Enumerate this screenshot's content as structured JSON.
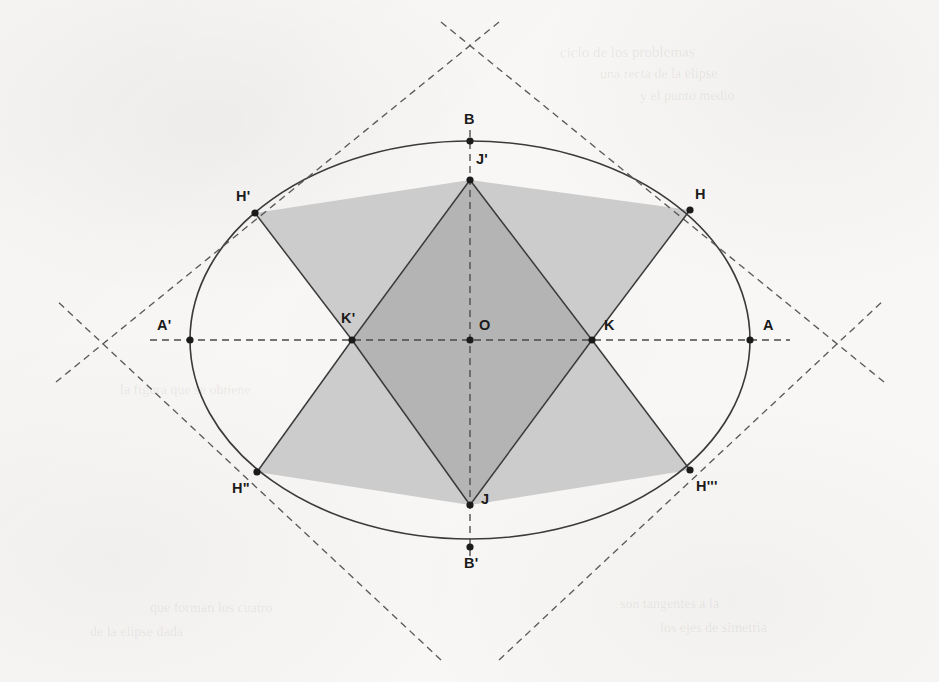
{
  "figure": {
    "background_color": "#f8f7f5",
    "stroke_color": "#3a3a3a",
    "dash_color": "#5a5a5a",
    "fill_light": "#cccccc",
    "fill_dark": "#b4b4b4",
    "point_color": "#1b1b1b",
    "canvas": {
      "width": 939,
      "height": 682
    },
    "ellipse": {
      "center": {
        "x": 470,
        "y": 340
      },
      "semi_major_a": 280,
      "semi_minor_b": 199
    },
    "points": [
      {
        "name": "A",
        "label": "A",
        "x": 750,
        "y": 340,
        "label_x": 763,
        "label_y": 318,
        "dot": true
      },
      {
        "name": "A-prime",
        "label": "A'",
        "x": 190,
        "y": 340,
        "label_x": 157,
        "label_y": 318,
        "dot": true
      },
      {
        "name": "B",
        "label": "B",
        "x": 470,
        "y": 141,
        "label_x": 464,
        "label_y": 112,
        "dot": true
      },
      {
        "name": "B-prime",
        "label": "B'",
        "x": 470,
        "y": 547,
        "label_x": 464,
        "label_y": 556,
        "dot": true
      },
      {
        "name": "O",
        "label": "O",
        "x": 470,
        "y": 340,
        "label_x": 479,
        "label_y": 318,
        "dot": true
      },
      {
        "name": "H",
        "label": "H",
        "x": 690,
        "y": 210,
        "label_x": 695,
        "label_y": 187,
        "dot": true
      },
      {
        "name": "H-prime",
        "label": "H'",
        "x": 255,
        "y": 213,
        "label_x": 236,
        "label_y": 189,
        "dot": true
      },
      {
        "name": "H-double-prime",
        "label": "H\"",
        "x": 257,
        "y": 472,
        "label_x": 232,
        "label_y": 481,
        "dot": true
      },
      {
        "name": "H-triple-prime",
        "label": "H'''",
        "x": 690,
        "y": 470,
        "label_x": 696,
        "label_y": 479,
        "dot": true
      },
      {
        "name": "J",
        "label": "J",
        "x": 470,
        "y": 505,
        "label_x": 481,
        "label_y": 492,
        "dot": true
      },
      {
        "name": "J-prime",
        "label": "J'",
        "x": 470,
        "y": 180,
        "label_x": 476,
        "label_y": 152,
        "dot": true
      },
      {
        "name": "K",
        "label": "K",
        "x": 592,
        "y": 340,
        "label_x": 604,
        "label_y": 318,
        "dot": true
      },
      {
        "name": "K-prime",
        "label": "K'",
        "x": 352,
        "y": 340,
        "label_x": 341,
        "label_y": 311,
        "dot": true
      }
    ],
    "light_polygon": [
      {
        "x": 470,
        "y": 180
      },
      {
        "x": 690,
        "y": 210
      },
      {
        "x": 592,
        "y": 340
      },
      {
        "x": 690,
        "y": 470
      },
      {
        "x": 470,
        "y": 505
      },
      {
        "x": 257,
        "y": 472
      },
      {
        "x": 352,
        "y": 340
      },
      {
        "x": 255,
        "y": 213
      }
    ],
    "dark_polygon": [
      {
        "x": 470,
        "y": 180
      },
      {
        "x": 592,
        "y": 340
      },
      {
        "x": 470,
        "y": 505
      },
      {
        "x": 352,
        "y": 340
      }
    ],
    "solid_segments": [
      {
        "from": {
          "x": 255,
          "y": 213
        },
        "to": {
          "x": 352,
          "y": 340
        }
      },
      {
        "from": {
          "x": 352,
          "y": 340
        },
        "to": {
          "x": 257,
          "y": 472
        }
      },
      {
        "from": {
          "x": 690,
          "y": 210
        },
        "to": {
          "x": 592,
          "y": 340
        }
      },
      {
        "from": {
          "x": 592,
          "y": 340
        },
        "to": {
          "x": 690,
          "y": 470
        }
      },
      {
        "from": {
          "x": 470,
          "y": 180
        },
        "to": {
          "x": 352,
          "y": 340
        }
      },
      {
        "from": {
          "x": 470,
          "y": 180
        },
        "to": {
          "x": 592,
          "y": 340
        }
      },
      {
        "from": {
          "x": 470,
          "y": 505
        },
        "to": {
          "x": 352,
          "y": 340
        }
      },
      {
        "from": {
          "x": 470,
          "y": 505
        },
        "to": {
          "x": 592,
          "y": 340
        }
      }
    ],
    "dashed_axes": [
      {
        "name": "major-axis",
        "from": {
          "x": 150,
          "y": 340
        },
        "to": {
          "x": 790,
          "y": 340
        }
      },
      {
        "name": "minor-axis",
        "from": {
          "x": 470,
          "y": 130
        },
        "to": {
          "x": 470,
          "y": 556
        }
      }
    ],
    "tangent_lines": [
      {
        "name": "tangent-upper-right",
        "from": {
          "x": 441,
          "y": 22
        },
        "to": {
          "x": 884,
          "y": 382
        }
      },
      {
        "name": "tangent-upper-left",
        "from": {
          "x": 499,
          "y": 22
        },
        "to": {
          "x": 56,
          "y": 382
        }
      },
      {
        "name": "tangent-lower-right",
        "from": {
          "x": 499,
          "y": 660
        },
        "to": {
          "x": 884,
          "y": 300
        }
      },
      {
        "name": "tangent-lower-left",
        "from": {
          "x": 441,
          "y": 660
        },
        "to": {
          "x": 56,
          "y": 300
        }
      }
    ],
    "tangent_vertices": [
      {
        "name": "tangent-vertex-top",
        "x": 470,
        "y": 48
      },
      {
        "name": "tangent-vertex-right",
        "x": 859,
        "y": 340
      },
      {
        "name": "tangent-vertex-bottom",
        "x": 472,
        "y": 640
      },
      {
        "name": "tangent-vertex-left",
        "x": 83,
        "y": 343
      }
    ],
    "ghost_texts": [
      {
        "text": "ciclo de los problemas",
        "x": 560,
        "y": 44,
        "size": 15,
        "rotate": -0.4
      },
      {
        "text": "una recta de la elipse",
        "x": 600,
        "y": 66,
        "size": 14,
        "rotate": -0.3
      },
      {
        "text": "y el punto medio",
        "x": 640,
        "y": 88,
        "size": 14,
        "rotate": -0.2
      },
      {
        "text": "la figura que se obtiene",
        "x": 120,
        "y": 382,
        "size": 14,
        "rotate": 0.2
      },
      {
        "text": "que forman los cuatro",
        "x": 150,
        "y": 600,
        "size": 14,
        "rotate": 0.2
      },
      {
        "text": "de la elipse dada",
        "x": 90,
        "y": 624,
        "size": 14,
        "rotate": 0.1
      },
      {
        "text": "son tangentes a la",
        "x": 620,
        "y": 596,
        "size": 14,
        "rotate": -0.2
      },
      {
        "text": "los ejes de simetria",
        "x": 660,
        "y": 620,
        "size": 14,
        "rotate": -0.2
      }
    ]
  }
}
